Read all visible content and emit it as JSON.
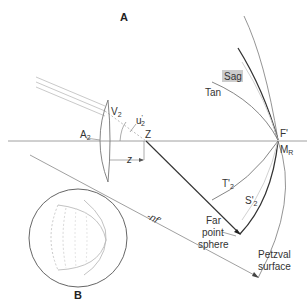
{
  "diagram": {
    "panel_a_label": "A",
    "panel_b_label": "B",
    "labels": {
      "v2": "V",
      "v2_sub": "2",
      "u2": "u",
      "u2_sup": "'",
      "u2_sub": "2",
      "a2": "A",
      "a2_sub": "2",
      "z_point": "Z",
      "z_distance": "z",
      "f_prime": "F'",
      "mr": "M",
      "mr_sub": "R",
      "sag": "Sag",
      "tan": "Tan",
      "t2": "T'",
      "t2_sub": "2",
      "s2": "S'",
      "s2_sub": "2",
      "far_point_1": "Far",
      "far_point_2": "point",
      "far_point_3": "sphere",
      "petzval_1": "Petzval",
      "petzval_2": "surface",
      "nf": "-nf'"
    },
    "colors": {
      "axis": "#888888",
      "curve_dark": "#333333",
      "curve_mid": "#777777",
      "curve_light": "#bbbbbb",
      "sag_highlight": "#cccccc"
    }
  }
}
